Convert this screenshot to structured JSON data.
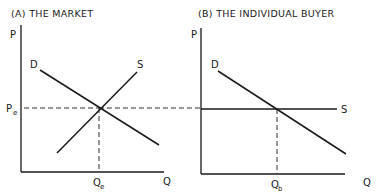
{
  "panels": {
    "market": {
      "title": "(A) THE MARKET",
      "y_axis_label": "P",
      "x_axis_label": "Q",
      "demand_label": "D",
      "supply_label": "S",
      "price_label": "P",
      "price_sub": "e",
      "quantity_label": "Q",
      "quantity_sub": "e"
    },
    "individual": {
      "title": "(B) THE INDIVIDUAL  BUYER",
      "y_axis_label": "P",
      "x_axis_label": "Q",
      "demand_label": "D",
      "supply_label": "S",
      "quantity_label": "Q",
      "quantity_sub": "b"
    }
  },
  "colors": {
    "ink": "#1a1a1a",
    "background": "#ffffff"
  }
}
